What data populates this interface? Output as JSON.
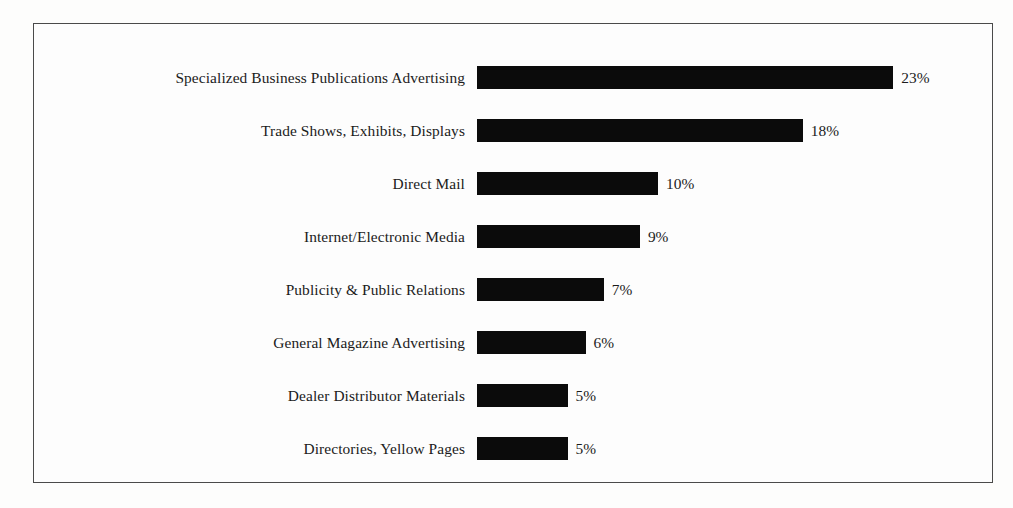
{
  "chart_data": {
    "type": "bar",
    "orientation": "horizontal",
    "title": "",
    "subtitle": "",
    "xlabel": "",
    "ylabel": "",
    "xlim": [
      0,
      23
    ],
    "grid": false,
    "legend": null,
    "value_suffix": "%",
    "categories": [
      "Specialized Business Publications Advertising",
      "Trade Shows, Exhibits, Displays",
      "Direct Mail",
      "Internet/Electronic Media",
      "Publicity & Public Relations",
      "General Magazine Advertising",
      "Dealer Distributor Materials",
      "Directories, Yellow Pages"
    ],
    "values": [
      23,
      18,
      10,
      9,
      7,
      6,
      5,
      5
    ],
    "value_labels": [
      "23%",
      "18%",
      "10%",
      "9%",
      "7%",
      "6%",
      "5%",
      "5%"
    ],
    "bars": [
      {
        "label": "Specialized Business Publications Advertising",
        "value": 23,
        "value_label": "23%"
      },
      {
        "label": "Trade Shows, Exhibits, Displays",
        "value": 18,
        "value_label": "18%"
      },
      {
        "label": "Direct Mail",
        "value": 10,
        "value_label": "10%"
      },
      {
        "label": "Internet/Electronic Media",
        "value": 9,
        "value_label": "9%"
      },
      {
        "label": "Publicity & Public Relations",
        "value": 7,
        "value_label": "7%"
      },
      {
        "label": "General Magazine Advertising",
        "value": 6,
        "value_label": "6%"
      },
      {
        "label": "Dealer Distributor Materials",
        "value": 5,
        "value_label": "5%"
      },
      {
        "label": "Directories, Yellow Pages",
        "value": 5,
        "value_label": "5%"
      }
    ],
    "colors": {
      "bar": "#0b0b0b",
      "frame": "#4a4a4a",
      "background": "#fdfdfd",
      "text": "#1b1b1b"
    }
  }
}
